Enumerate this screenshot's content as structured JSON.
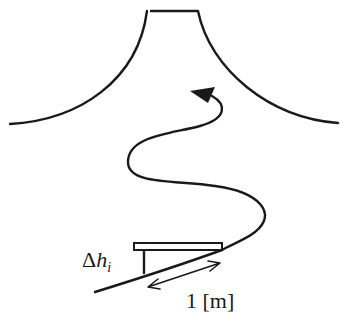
{
  "diagram": {
    "labels": {
      "delta_symbol": "Δ",
      "height_var": "h",
      "height_subscript": "i",
      "length": "1 [m]"
    },
    "colors": {
      "stroke": "#1a1a1a",
      "background": "#ffffff"
    },
    "elements": [
      "mountain-outline",
      "winding-path-arrow",
      "slope-line",
      "plank",
      "height-marker",
      "length-double-arrow"
    ]
  }
}
